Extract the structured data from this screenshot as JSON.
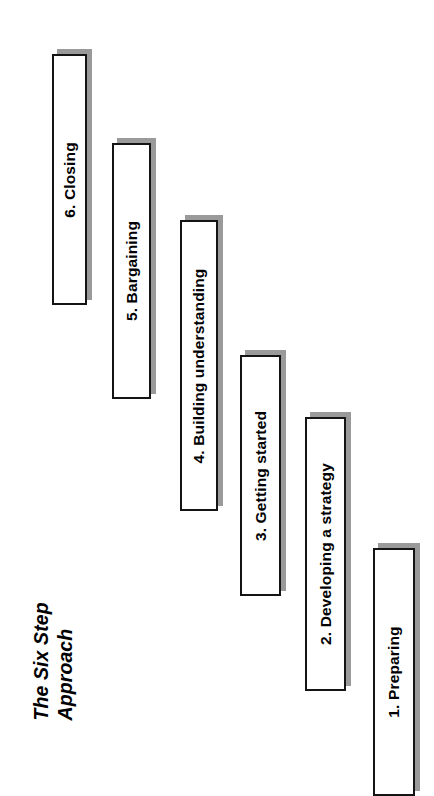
{
  "diagram": {
    "title_lines": [
      "The Six Step",
      "Approach"
    ],
    "orientation": "rotated-90-ccw",
    "colors": {
      "box_fill": "#ffffff",
      "box_border": "#141414",
      "shadow": "#9a9a9a",
      "text": "#000000",
      "background": "#ffffff"
    },
    "steps": [
      {
        "number": "1.",
        "label": "1. Preparing",
        "name": "step-1-preparing",
        "left": 373,
        "top": 548,
        "width": 42,
        "height": 248
      },
      {
        "number": "2.",
        "label": "2. Developing a strategy",
        "name": "step-2-developing-a-strategy",
        "left": 305,
        "top": 417,
        "width": 41,
        "height": 274
      },
      {
        "number": "3.",
        "label": "3. Getting started",
        "name": "step-3-getting-started",
        "left": 240,
        "top": 355,
        "width": 41,
        "height": 241
      },
      {
        "number": "4.",
        "label": "4. Building understanding",
        "name": "step-4-building-understanding",
        "left": 180,
        "top": 220,
        "width": 38,
        "height": 291
      },
      {
        "number": "5.",
        "label": "5. Bargaining",
        "name": "step-5-bargaining",
        "left": 112,
        "top": 143,
        "width": 39,
        "height": 256
      },
      {
        "number": "6.",
        "label": "6. Closing",
        "name": "step-6-closing",
        "left": 52,
        "top": 54,
        "width": 35,
        "height": 251
      }
    ]
  }
}
